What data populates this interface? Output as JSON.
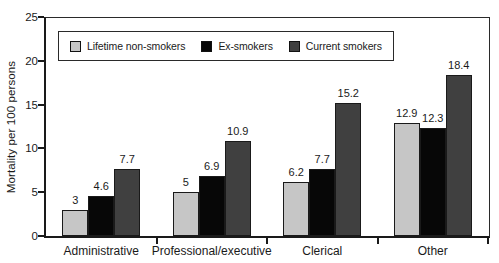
{
  "chart_data": {
    "type": "bar",
    "title": "",
    "ylabel": "Mortality per 100 persons",
    "xlabel": "",
    "ylim": [
      0,
      25
    ],
    "yticks": [
      0,
      5,
      10,
      15,
      20,
      25
    ],
    "grid": false,
    "legend_position": "top-left-inside",
    "categories": [
      "Administrative",
      "Professional/executive",
      "Clerical",
      "Other"
    ],
    "series": [
      {
        "name": "Lifetime non-smokers",
        "color": "#c6c6c6",
        "values": [
          3,
          5,
          6.2,
          12.9
        ]
      },
      {
        "name": "Ex-smokers",
        "color": "#070707",
        "values": [
          4.6,
          6.9,
          7.7,
          12.3
        ]
      },
      {
        "name": "Current smokers",
        "color": "#404040",
        "values": [
          7.7,
          10.9,
          15.2,
          18.4
        ]
      }
    ],
    "colors": {
      "axis": "#1a1a1a",
      "text": "#1a1a1a",
      "background": "#ffffff"
    }
  }
}
